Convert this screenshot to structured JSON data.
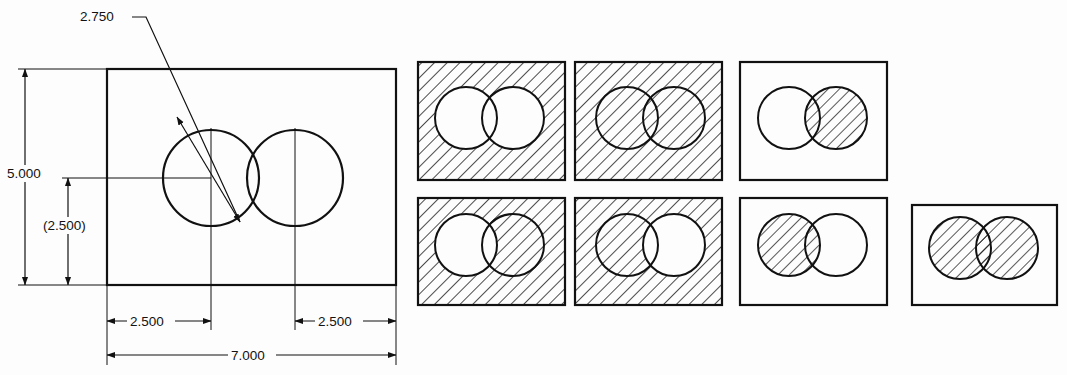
{
  "drawing": {
    "title": "Two overlapping circles in rectangular plate with section-lining variants",
    "units": "inches",
    "line_color": "#111111",
    "background_color": "#fdfdfd",
    "dimensions": {
      "overall_width": "7.000",
      "overall_height": "5.000",
      "left_circle_x": "2.500",
      "right_circle_x": "2.500",
      "circle_center_height": "(2.500)",
      "circle_diameter": "2.750"
    },
    "labels": {
      "diameter_leader": "2.750",
      "height_overall": "5.000",
      "height_reference": "(2.500)",
      "width_left": "2.500",
      "width_right": "2.500",
      "width_overall": "7.000"
    }
  },
  "main_view": {
    "rect": {
      "x": 107,
      "y": 69,
      "w": 289,
      "h": 216
    },
    "circles": [
      {
        "name": "left-circle",
        "cx": 211,
        "cy": 178,
        "r": 48
      },
      {
        "name": "right-circle",
        "cx": 295,
        "cy": 178,
        "r": 48
      }
    ]
  },
  "variants": {
    "hatch_angle_deg": 45,
    "rows": [
      {
        "row": 1,
        "cells": [
          {
            "id": "r1c1",
            "x": 418,
            "y": 62,
            "w": 147,
            "h": 118,
            "rect_hatched": true,
            "left_circle_hatched": false,
            "right_circle_hatched": false,
            "overlap_hatched": false,
            "description": "plate section-lined, both holes open"
          },
          {
            "id": "r1c2",
            "x": 575,
            "y": 62,
            "w": 147,
            "h": 118,
            "rect_hatched": true,
            "left_circle_hatched": true,
            "right_circle_hatched": true,
            "overlap_hatched": true,
            "description": "entire plate and both circles section-lined"
          },
          {
            "id": "r1c3",
            "x": 740,
            "y": 62,
            "w": 147,
            "h": 118,
            "rect_hatched": false,
            "left_circle_hatched": false,
            "right_circle_hatched": true,
            "overlap_hatched": true,
            "description": "plate open, right circle section-lined"
          }
        ]
      },
      {
        "row": 2,
        "cells": [
          {
            "id": "r2c1",
            "x": 418,
            "y": 198,
            "w": 147,
            "h": 107,
            "rect_hatched": true,
            "left_circle_hatched": false,
            "right_circle_hatched": true,
            "overlap_hatched": true,
            "description": "plate section-lined, left hole open, right circle section-lined"
          },
          {
            "id": "r2c2",
            "x": 575,
            "y": 198,
            "w": 147,
            "h": 107,
            "rect_hatched": true,
            "left_circle_hatched": true,
            "right_circle_hatched": false,
            "overlap_hatched": true,
            "description": "plate section-lined, left circle section-lined, right hole open"
          },
          {
            "id": "r2c3",
            "x": 740,
            "y": 198,
            "w": 147,
            "h": 107,
            "rect_hatched": false,
            "left_circle_hatched": true,
            "right_circle_hatched": false,
            "overlap_hatched": true,
            "description": "plate open, left circle section-lined"
          },
          {
            "id": "r2c4",
            "x": 912,
            "y": 205,
            "w": 145,
            "h": 100,
            "rect_hatched": false,
            "left_circle_hatched": true,
            "right_circle_hatched": true,
            "overlap_hatched": true,
            "description": "plate open, both circles section-lined"
          }
        ]
      }
    ]
  }
}
